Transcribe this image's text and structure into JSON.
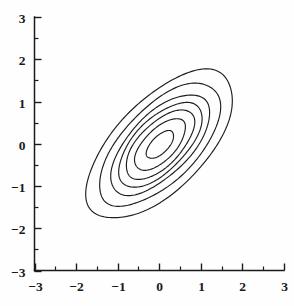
{
  "figure": {
    "title": "",
    "background_color": "#fefefe",
    "line_color": "#1d1d1d",
    "width": 294,
    "height": 306
  },
  "chart_data": {
    "type": "line",
    "subtype": "contour",
    "title": "",
    "xlabel": "",
    "ylabel": "",
    "xlim": [
      -3,
      3
    ],
    "ylim": [
      -3,
      3
    ],
    "xticks": [
      -3,
      -2,
      -1,
      0,
      1,
      2,
      3
    ],
    "yticks": [
      -3,
      -2,
      -1,
      0,
      1,
      2,
      3
    ],
    "xtick_labels": [
      "−3",
      "−2",
      "−1",
      "0",
      "1",
      "2",
      "3"
    ],
    "ytick_labels": [
      "−3",
      "−2",
      "−1",
      "0",
      "1",
      "2",
      "3"
    ],
    "minor_ticks": [
      -2.5,
      -1.5,
      -0.5,
      0.5,
      1.5,
      2.5
    ],
    "grid": false,
    "legend": null,
    "annotations": [],
    "distribution": {
      "mean": [
        0,
        0
      ],
      "sd_x": 1.0,
      "sd_y": 1.0,
      "correlation": 0.7,
      "rotation_deg": 45
    },
    "contours": [
      {
        "index": 1,
        "semi_major": 0.42,
        "semi_minor": 0.2
      },
      {
        "index": 2,
        "semi_major": 0.78,
        "semi_minor": 0.37
      },
      {
        "index": 3,
        "semi_major": 1.05,
        "semi_minor": 0.5
      },
      {
        "index": 4,
        "semi_major": 1.28,
        "semi_minor": 0.61
      },
      {
        "index": 5,
        "semi_major": 1.52,
        "semi_minor": 0.72
      },
      {
        "index": 6,
        "semi_major": 1.86,
        "semi_minor": 0.88
      },
      {
        "index": 7,
        "semi_major": 2.25,
        "semi_minor": 1.07
      }
    ],
    "series": [
      {
        "name": "contour-1",
        "semi_major": 0.42,
        "semi_minor": 0.2,
        "angle_deg": 45
      },
      {
        "name": "contour-2",
        "semi_major": 0.78,
        "semi_minor": 0.37,
        "angle_deg": 45
      },
      {
        "name": "contour-3",
        "semi_major": 1.05,
        "semi_minor": 0.5,
        "angle_deg": 45
      },
      {
        "name": "contour-4",
        "semi_major": 1.28,
        "semi_minor": 0.61,
        "angle_deg": 45
      },
      {
        "name": "contour-5",
        "semi_major": 1.52,
        "semi_minor": 0.72,
        "angle_deg": 45
      },
      {
        "name": "contour-6",
        "semi_major": 1.86,
        "semi_minor": 0.88,
        "angle_deg": 45
      },
      {
        "name": "contour-7",
        "semi_major": 2.25,
        "semi_minor": 1.07,
        "angle_deg": 45
      }
    ]
  }
}
